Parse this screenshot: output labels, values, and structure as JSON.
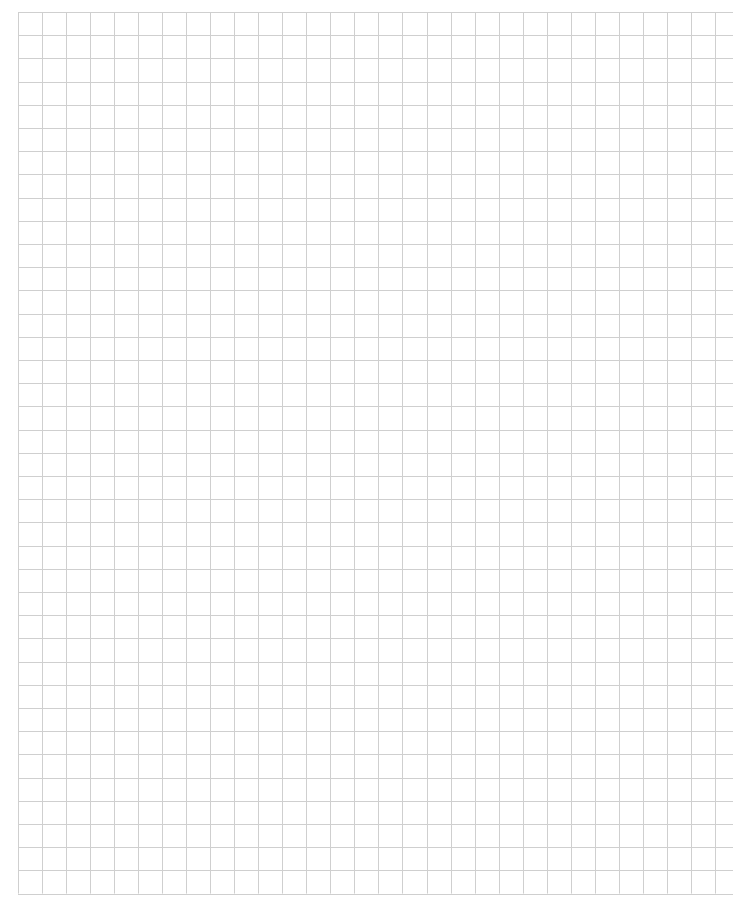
{
  "page": {
    "type": "graph-paper",
    "background_color": "#ffffff",
    "line_color": "#cfcfcf"
  },
  "grid": {
    "left": 18,
    "top": 12,
    "columns": 29,
    "rows": 38,
    "cell_width": 24.03,
    "cell_height": 23.2,
    "horizontal_line_extent_right": 733,
    "line_width": 1
  }
}
